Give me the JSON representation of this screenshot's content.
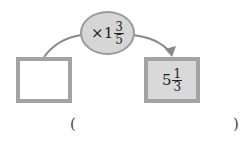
{
  "operator": {
    "symbol": "×",
    "whole": "1",
    "numerator": "3",
    "denominator": "5"
  },
  "input_box": {
    "value": ""
  },
  "output_box": {
    "whole": "5",
    "numerator": "1",
    "denominator": "3"
  },
  "answer": {
    "open": "(",
    "close": ")",
    "value": ""
  },
  "colors": {
    "oval_fill": "#d6d6d6",
    "box_border": "#a3a3a3",
    "output_fill": "#d9d9d9",
    "arrow": "#8a8a8a"
  }
}
